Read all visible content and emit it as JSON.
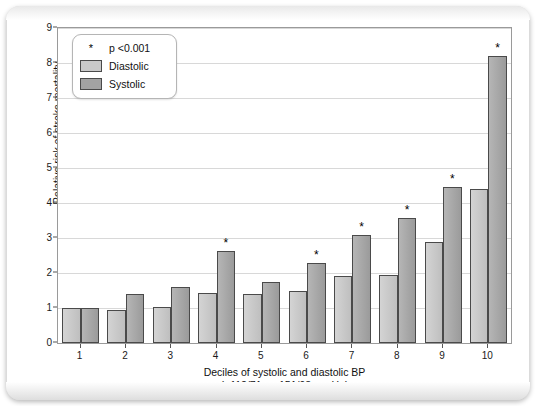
{
  "chart_data": {
    "type": "bar",
    "title": "",
    "xlabel": "Deciles of systolic and diastolic BP",
    "xlabel_sub": "(<112/71 – ≥151/98 mmHg)",
    "ylabel": "Relative risk of stroke mortality",
    "ylim": [
      0,
      9
    ],
    "yticks": [
      0,
      1,
      2,
      3,
      4,
      5,
      6,
      7,
      8,
      9
    ],
    "grid": true,
    "legend_position": "top-left",
    "categories": [
      "1",
      "2",
      "3",
      "4",
      "5",
      "6",
      "7",
      "8",
      "9",
      "10"
    ],
    "series": [
      {
        "name": "Diastolic",
        "color": "#c9c9c9",
        "values": [
          1.0,
          0.95,
          1.02,
          1.42,
          1.4,
          1.5,
          1.92,
          1.95,
          2.88,
          4.4
        ],
        "significance": [
          "",
          "",
          "",
          "",
          "",
          "",
          "",
          "",
          "",
          ""
        ]
      },
      {
        "name": "Systolic",
        "color": "#a3a3a3",
        "values": [
          1.0,
          1.4,
          1.6,
          2.62,
          1.75,
          2.28,
          3.1,
          3.58,
          4.45,
          8.2
        ],
        "significance": [
          "",
          "",
          "",
          "*",
          "",
          "*",
          "*",
          "*",
          "*",
          "*"
        ]
      }
    ],
    "annotations": {
      "significance_marker": "*",
      "significance_note": "p <0.001"
    }
  },
  "legend": {
    "note_marker": "*",
    "note_text": "p <0.001",
    "items": [
      {
        "label": "Diastolic",
        "color": "#c9c9c9"
      },
      {
        "label": "Systolic",
        "color": "#a3a3a3"
      }
    ]
  }
}
